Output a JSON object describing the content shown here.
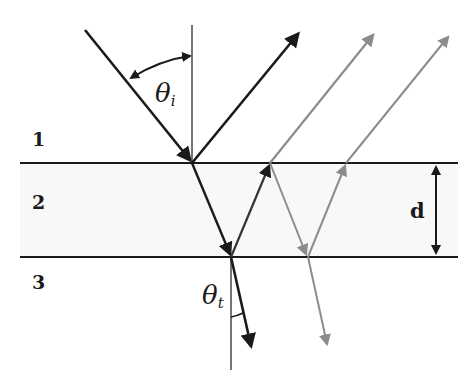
{
  "figure": {
    "colors": {
      "primary": "#1a1a1a",
      "secondary": "#8c8c8c",
      "layer_fill": "#f7f7f7"
    }
  },
  "media": {
    "layer_1": "1",
    "layer_2": "2",
    "layer_3": "3"
  },
  "angles": {
    "incident": {
      "symbol": "θ",
      "subscript": "i"
    },
    "transmitted": {
      "symbol": "θ",
      "subscript": "t"
    }
  },
  "thickness": {
    "label": "d"
  }
}
